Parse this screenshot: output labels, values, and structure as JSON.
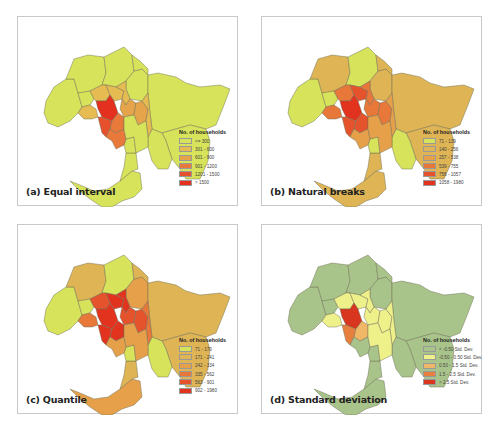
{
  "chart_data": [
    {
      "type": "choropleth-map",
      "title": "(a) Equal interval",
      "legend_title": "No. of households",
      "classes": [
        {
          "label": "<= 300",
          "color": "#d7e35a"
        },
        {
          "label": "301 - 600",
          "color": "#e6bb52"
        },
        {
          "label": "601 - 900",
          "color": "#e6a44a"
        },
        {
          "label": "901 - 1200",
          "color": "#e9793a"
        },
        {
          "label": "1201 - 1500",
          "color": "#e6502c"
        },
        {
          "label": "> 1500",
          "color": "#e3301f"
        }
      ],
      "region_class": {
        "west": 0,
        "northwest": 0,
        "north1": 0,
        "north2": 0,
        "north3": 0,
        "northeast": 0,
        "east": 0,
        "southeast": 0,
        "peninsula": 0,
        "south1": 0,
        "south2": 0,
        "midwest": 0,
        "innerW": 1,
        "innerN1": 1,
        "innerN2": 1,
        "innerNE": 1,
        "innerE1": 2,
        "innerE2": 2,
        "innerE3": 1,
        "cbd": 5,
        "bayside1": 4,
        "bayside2": 3,
        "innerS": 3,
        "seW": 0
      }
    },
    {
      "type": "choropleth-map",
      "title": "(b) Natural breaks",
      "legend_title": "No. of households",
      "classes": [
        {
          "label": "71 - 139",
          "color": "#d7e35a"
        },
        {
          "label": "140 - 256",
          "color": "#deb455"
        },
        {
          "label": "257 - 538",
          "color": "#e6a04a"
        },
        {
          "label": "539 - 755",
          "color": "#e8773a"
        },
        {
          "label": "756 - 1057",
          "color": "#e5532d"
        },
        {
          "label": "1058 - 1980",
          "color": "#e2331f"
        }
      ],
      "region_class": {
        "west": 0,
        "northwest": 1,
        "north1": 0,
        "north2": 1,
        "north3": 1,
        "northeast": 1,
        "east": 1,
        "southeast": 0,
        "peninsula": 1,
        "south1": 1,
        "south2": 0,
        "midwest": 0,
        "innerW": 3,
        "innerN1": 3,
        "innerN2": 4,
        "innerNE": 3,
        "innerE1": 3,
        "innerE2": 3,
        "innerE3": 2,
        "cbd": 5,
        "bayside1": 4,
        "bayside2": 4,
        "innerS": 2,
        "seW": 2
      }
    },
    {
      "type": "choropleth-map",
      "title": "(c) Quantile",
      "legend_title": "No. of households",
      "classes": [
        {
          "label": "71 - 170",
          "color": "#d7e35a"
        },
        {
          "label": "171 - 241",
          "color": "#deb455"
        },
        {
          "label": "242 - 334",
          "color": "#e6a04a"
        },
        {
          "label": "335 - 562",
          "color": "#e8773a"
        },
        {
          "label": "563 - 901",
          "color": "#e5532d"
        },
        {
          "label": "902 - 1980",
          "color": "#e2331f"
        }
      ],
      "region_class": {
        "west": 0,
        "northwest": 1,
        "north1": 0,
        "north2": 2,
        "north3": 1,
        "northeast": 1,
        "east": 1,
        "southeast": 0,
        "peninsula": 2,
        "south1": 1,
        "south2": 0,
        "midwest": 0,
        "innerW": 3,
        "innerN1": 4,
        "innerN2": 5,
        "innerNE": 5,
        "innerE1": 4,
        "innerE2": 4,
        "innerE3": 3,
        "cbd": 5,
        "bayside1": 5,
        "bayside2": 5,
        "innerS": 2,
        "seW": 2
      }
    },
    {
      "type": "choropleth-map",
      "title": "(d) Standard deviation",
      "legend_title": "No. of households",
      "classes": [
        {
          "label": "< -0.50 Std. Dev.",
          "color": "#a9c48a"
        },
        {
          "label": "-0.50 - 0.50 Std. Dev.",
          "color": "#eef08a"
        },
        {
          "label": "0.50 - 1.5 Std. Dev.",
          "color": "#f0b866"
        },
        {
          "label": "1.5 - 2.5 Std. Dev.",
          "color": "#e7803f"
        },
        {
          "label": "> 2.5 Std. Dev.",
          "color": "#d8361f"
        }
      ],
      "region_class": {
        "west": 0,
        "northwest": 0,
        "north1": 0,
        "north2": 0,
        "north3": 0,
        "northeast": 0,
        "east": 0,
        "southeast": 0,
        "peninsula": 0,
        "south1": 0,
        "south2": 0,
        "midwest": 0,
        "innerW": 1,
        "innerN1": 1,
        "innerN2": 1,
        "innerNE": 1,
        "innerE1": 1,
        "innerE2": 1,
        "innerE3": 1,
        "cbd": 4,
        "bayside1": 3,
        "bayside2": 2,
        "innerS": 0,
        "seW": 1
      }
    }
  ],
  "panels": [
    {
      "caption": "(a) Equal interval"
    },
    {
      "caption": "(b) Natural breaks"
    },
    {
      "caption": "(c) Quantile"
    },
    {
      "caption": "(d) Standard deviation"
    }
  ]
}
